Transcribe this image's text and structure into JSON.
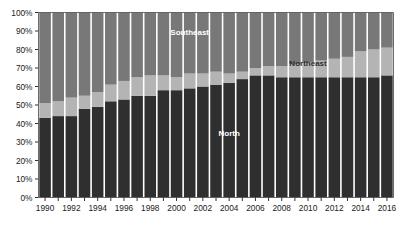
{
  "chart_data": {
    "type": "bar",
    "subtype": "stacked-100-percent",
    "title": "",
    "xlabel": "",
    "ylabel": "",
    "ylim": [
      0,
      100
    ],
    "yunit": "%",
    "grid": false,
    "legend_position": "inline-annotations",
    "x": [
      1990,
      1991,
      1992,
      1993,
      1994,
      1995,
      1996,
      1997,
      1998,
      1999,
      2000,
      2001,
      2002,
      2003,
      2004,
      2005,
      2006,
      2007,
      2008,
      2009,
      2010,
      2011,
      2012,
      2013,
      2014,
      2015,
      2016
    ],
    "categories": [
      "1990",
      "1991",
      "1992",
      "1993",
      "1994",
      "1995",
      "1996",
      "1997",
      "1998",
      "1999",
      "2000",
      "2001",
      "2002",
      "2003",
      "2004",
      "2005",
      "2006",
      "2007",
      "2008",
      "2009",
      "2010",
      "2011",
      "2012",
      "2013",
      "2014",
      "2015",
      "2016"
    ],
    "xtick_labels": [
      "1990",
      "1992",
      "1994",
      "1996",
      "1998",
      "2000",
      "2002",
      "2004",
      "2006",
      "2008",
      "2010",
      "2012",
      "2014",
      "2016"
    ],
    "ytick_labels": [
      "0%",
      "10%",
      "20%",
      "30%",
      "40%",
      "50%",
      "60%",
      "70%",
      "80%",
      "90%",
      "100%"
    ],
    "ytick_values": [
      0,
      10,
      20,
      30,
      40,
      50,
      60,
      70,
      80,
      90,
      100
    ],
    "series": [
      {
        "name": "North",
        "color": "#2f2f2f",
        "label_color": "#ffffff",
        "values": [
          43,
          44,
          44,
          48,
          49,
          52,
          53,
          55,
          55,
          58,
          58,
          59,
          60,
          61,
          62,
          64,
          66,
          66,
          65,
          65,
          65,
          65,
          65,
          65,
          65,
          65,
          66
        ]
      },
      {
        "name": "Northeast",
        "color": "#b4b4b4",
        "label_color": "#2f2f2f",
        "values": [
          8,
          8,
          10,
          7,
          8,
          9,
          10,
          10,
          11,
          8,
          7,
          8,
          7,
          7,
          5,
          4,
          4,
          5,
          6,
          7,
          8,
          9,
          10,
          11,
          14,
          15,
          15
        ]
      },
      {
        "name": "Southeast",
        "color": "#787878",
        "label_color": "#ffffff",
        "values": [
          49,
          48,
          46,
          45,
          43,
          39,
          37,
          35,
          34,
          34,
          35,
          33,
          33,
          32,
          33,
          32,
          30,
          29,
          29,
          28,
          27,
          26,
          25,
          24,
          21,
          20,
          19
        ]
      }
    ],
    "annotations": [
      {
        "text": "Southeast",
        "x_index": 11,
        "y_value": 88,
        "color": "#ffffff"
      },
      {
        "text": "Northeast",
        "x_index": 20,
        "y_value": 71,
        "color": "#2f2f2f"
      },
      {
        "text": "North",
        "x_index": 14,
        "y_value": 33,
        "color": "#ffffff"
      }
    ]
  },
  "plot": {
    "background": "#ffffff",
    "axis_color": "#5a5a5a",
    "tick_color": "#1a1a1a",
    "bar_gap_color": "#ffffff"
  }
}
